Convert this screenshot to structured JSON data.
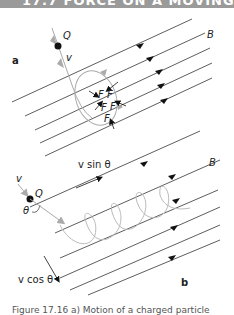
{
  "header": {
    "title": "17.7  FORCE ON A MOVING CHARGE"
  },
  "panel_a": {
    "label": "a",
    "charge_label": "Q",
    "velocity_label": "v",
    "field_label": "B",
    "force_label": "F"
  },
  "panel_b": {
    "label": "b",
    "charge_label": "Q",
    "velocity_label": "v",
    "angle_label": "θ",
    "parallel_component_label": "v sin θ",
    "perpendicular_component_label": "v cos θ",
    "field_label": "B"
  },
  "caption": {
    "text": "Figure 17.16  a) Motion of a charged particle"
  },
  "colors": {
    "header_bg": "#9a9a9a",
    "field_line": "#333333",
    "path": "#aaaaaa",
    "charge": "#111111"
  }
}
